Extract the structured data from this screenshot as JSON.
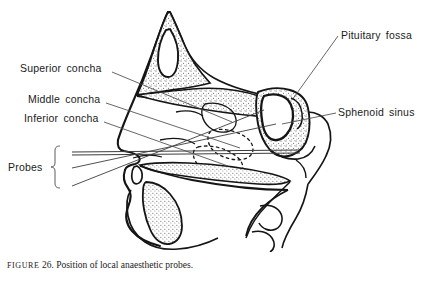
{
  "figure": {
    "title": "Position of local anaesthetic probes",
    "caption_prefix": "FIGURE",
    "caption_number": "26.",
    "caption_text": "Position of local anaesthetic probes."
  },
  "labels": {
    "superior_concha": "Superior  concha",
    "middle_concha": "Middle  concha",
    "inferior_concha": "Inferior  concha",
    "probes": "Probes",
    "pituitary_fossa": "Pituitary  fossa",
    "sphenoid_sinus": "Sphenoid  sinus"
  },
  "colors": {
    "ink": "#1b1b1b",
    "line": "#2a2a2a",
    "leader": "#4a4a4a",
    "background": "#ffffff",
    "stipple": "#3a3a3a"
  },
  "annotations": {
    "probe_count": 3,
    "leader_lines": 6
  }
}
